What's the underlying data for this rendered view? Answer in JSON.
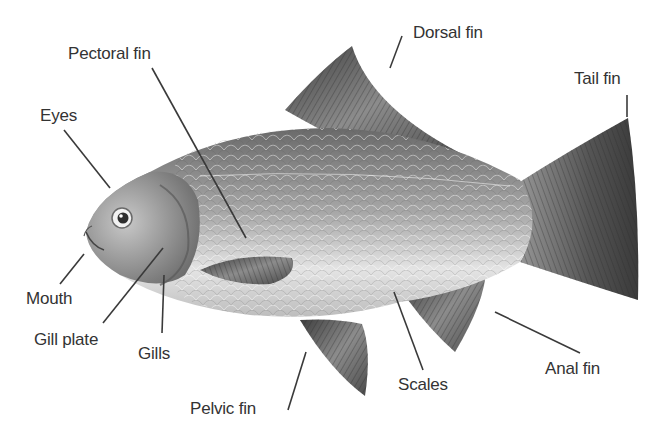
{
  "diagram": {
    "labels": [
      {
        "id": "pectoral-fin",
        "text": "Pectoral fin",
        "x": 68,
        "y": 45,
        "line": [
          152,
          68,
          246,
          238
        ]
      },
      {
        "id": "dorsal-fin",
        "text": "Dorsal fin",
        "x": 413,
        "y": 24,
        "line": [
          402,
          36,
          390,
          68
        ]
      },
      {
        "id": "tail-fin",
        "text": "Tail fin",
        "x": 574,
        "y": 70,
        "line": [
          627,
          95,
          627,
          117
        ]
      },
      {
        "id": "eyes",
        "text": "Eyes",
        "x": 40,
        "y": 107,
        "line": [
          64,
          130,
          110,
          188
        ]
      },
      {
        "id": "mouth",
        "text": "Mouth",
        "x": 26,
        "y": 290,
        "line": [
          60,
          284,
          84,
          254
        ]
      },
      {
        "id": "gill-plate",
        "text": "Gill plate",
        "x": 34,
        "y": 331,
        "line": [
          103,
          323,
          163,
          248
        ]
      },
      {
        "id": "gills",
        "text": "Gills",
        "x": 138,
        "y": 345,
        "line": [
          162,
          333,
          164,
          275
        ]
      },
      {
        "id": "pelvic-fin",
        "text": "Pelvic fin",
        "x": 190,
        "y": 400,
        "line": [
          288,
          410,
          306,
          352
        ]
      },
      {
        "id": "scales",
        "text": "Scales",
        "x": 398,
        "y": 376,
        "line": [
          423,
          370,
          394,
          292
        ]
      },
      {
        "id": "anal-fin",
        "text": "Anal fin",
        "x": 545,
        "y": 360,
        "line": [
          580,
          353,
          495,
          312
        ]
      }
    ],
    "colors": {
      "text": "#333333",
      "leader_line": "#3a3a3a",
      "fin_dark": "#4a4a4a",
      "fin_mid": "#8a8a8a",
      "body_dark": "#6e6e6e",
      "body_light": "#e6e6e6",
      "background": "#ffffff"
    }
  }
}
